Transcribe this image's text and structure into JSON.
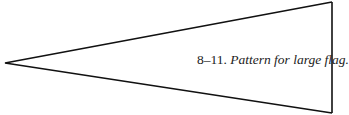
{
  "top_text_cutoff": "Figure text cut off at top edge",
  "figure": {
    "shape": "pennant-triangle",
    "stroke_color": "#111111",
    "vertices": {
      "tip": [
        5,
        63
      ],
      "top_right": [
        332,
        2
      ],
      "bottom_right": [
        332,
        113
      ]
    }
  },
  "caption": {
    "number": "8–11.",
    "title": "Pattern for large flag."
  }
}
